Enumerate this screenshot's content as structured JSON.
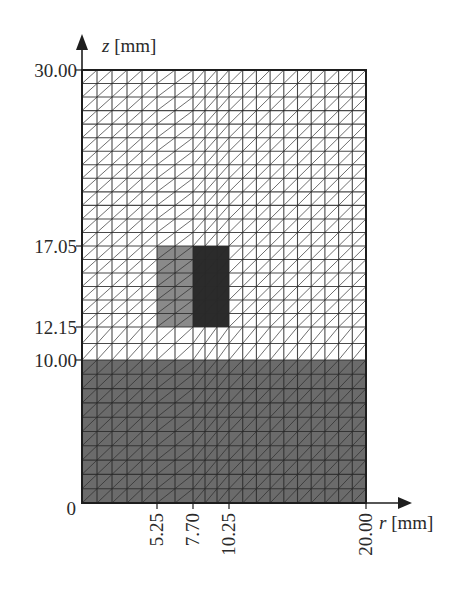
{
  "figure": {
    "axes": {
      "x_label_var": "r",
      "x_label_unit": " [mm]",
      "y_label_var": "z",
      "y_label_unit": " [mm]",
      "x_ticks": [
        {
          "value": 0,
          "label": "0"
        },
        {
          "value": 5.25,
          "label": "5.25"
        },
        {
          "value": 7.7,
          "label": "7.70"
        },
        {
          "value": 10.25,
          "label": "10.25"
        },
        {
          "value": 20.0,
          "label": "20.00"
        }
      ],
      "y_ticks": [
        {
          "value": 0,
          "label": "0"
        },
        {
          "value": 10.0,
          "label": "10.00"
        },
        {
          "value": 12.15,
          "label": "12.15"
        },
        {
          "value": 17.05,
          "label": "17.05"
        },
        {
          "value": 30.0,
          "label": "30.00"
        }
      ],
      "r_range": [
        0,
        20.0
      ],
      "z_range": [
        0,
        30.0
      ]
    },
    "mesh": {
      "r_lines": [
        0,
        1.05,
        2.1,
        3.15,
        4.2,
        5.25,
        6.475,
        7.7,
        8.55,
        9.4,
        10.25,
        11.225,
        12.2,
        13.175,
        14.15,
        15.125,
        16.1,
        17.075,
        18.05,
        19.025,
        20.0
      ],
      "z_lines": [
        0,
        1,
        2,
        3,
        4,
        5,
        6,
        7,
        8,
        9,
        10,
        11.075,
        12.15,
        12.967,
        13.783,
        14.6,
        15.417,
        16.233,
        17.05,
        18.046,
        19.042,
        20.038,
        21.035,
        22.031,
        23.027,
        24.023,
        25.019,
        26.015,
        27.012,
        28.008,
        29.004,
        30.0
      ],
      "diagonal_direction": "bottom-left to top-right"
    },
    "regions": [
      {
        "name": "substrate-layer",
        "r": [
          0,
          20.0
        ],
        "z": [
          0,
          10.0
        ],
        "color": "#6b6b6b"
      },
      {
        "name": "inclusion-left",
        "r": [
          5.25,
          7.7
        ],
        "z": [
          12.15,
          17.05
        ],
        "color": "#8a8a8a"
      },
      {
        "name": "inclusion-right",
        "r": [
          7.7,
          10.25
        ],
        "z": [
          12.15,
          17.05
        ],
        "color": "#2b2b2b"
      }
    ],
    "background_region_color": "#ffffff",
    "line_color": "#2a2a2a"
  }
}
